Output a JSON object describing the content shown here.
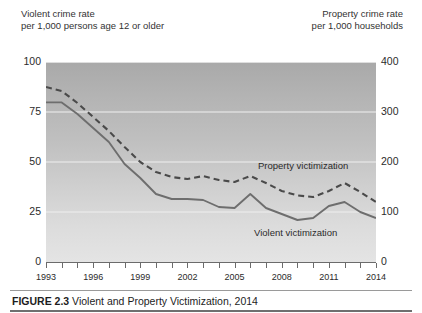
{
  "figure": {
    "caption_label": "FIGURE 2.3",
    "caption_title": "Violent and Property Victimization, 2014"
  },
  "left_axis": {
    "title": "Violent crime rate\nper 1,000 persons age 12 or older",
    "ticks": [
      "0",
      "25",
      "50",
      "75",
      "100"
    ]
  },
  "right_axis": {
    "title": "Property crime rate\nper 1,000 households",
    "ticks": [
      "0",
      "100",
      "200",
      "300",
      "400"
    ]
  },
  "series_labels": {
    "property": "Property victimization",
    "violent": "Violent victimization"
  },
  "chart_data": {
    "type": "line",
    "title": "Violent and Property Victimization, 2014",
    "xlabel": "",
    "ylabel": "Violent crime rate per 1,000 persons age 12 or older",
    "y2label": "Property crime rate per 1,000 households",
    "ylim": [
      0,
      100
    ],
    "y2lim": [
      0,
      400
    ],
    "grid": true,
    "legend": "inline-annotation",
    "x": [
      1993,
      1994,
      1995,
      1996,
      1997,
      1998,
      1999,
      2000,
      2001,
      2002,
      2003,
      2004,
      2005,
      2006,
      2007,
      2008,
      2009,
      2010,
      2011,
      2012,
      2013,
      2014
    ],
    "xticklabels": [
      "1993",
      "1996",
      "1999",
      "2002",
      "2005",
      "2008",
      "2011",
      "2014"
    ],
    "xtick_values": [
      1993,
      1996,
      1999,
      2002,
      2005,
      2008,
      2011,
      2014
    ],
    "series": [
      {
        "name": "Violent victimization",
        "axis": "left",
        "style": "solid",
        "color": "#6e6e6e",
        "values": [
          79.8,
          79.8,
          74.0,
          67.0,
          60.0,
          49.0,
          42.0,
          34.0,
          31.5,
          31.5,
          31.0,
          27.5,
          27.0,
          34.0,
          27.0,
          24.0,
          21.0,
          22.0,
          28.0,
          30.0,
          25.0,
          22.0
        ]
      },
      {
        "name": "Property victimization",
        "axis": "right",
        "style": "dashed",
        "color": "#4a4a4a",
        "values": [
          350,
          342,
          318,
          290,
          262,
          230,
          200,
          180,
          170,
          166,
          172,
          164,
          160,
          172,
          158,
          142,
          133,
          130,
          142,
          158,
          140,
          120
        ]
      }
    ]
  },
  "colors": {
    "violent_line": "#6e6e6e",
    "property_line": "#4a4a4a",
    "gridline": "#f0f0f0",
    "axis": "#6b6b6b"
  }
}
